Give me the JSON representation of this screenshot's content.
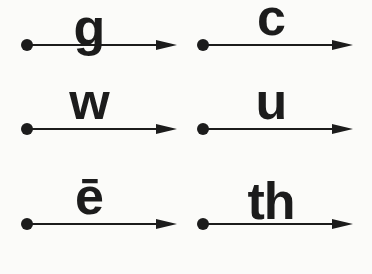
{
  "diagram": {
    "type": "labeled-arrow-grid",
    "description_semantics": "six dot-to-arrow timelines, each labeled with a phonics letter or digraph",
    "cells": [
      {
        "label": "g",
        "marker": "dot-icon",
        "pointer": "right-arrowhead-icon"
      },
      {
        "label": "c",
        "marker": "dot-icon",
        "pointer": "right-arrowhead-icon"
      },
      {
        "label": "w",
        "marker": "dot-icon",
        "pointer": "right-arrowhead-icon"
      },
      {
        "label": "u",
        "marker": "dot-icon",
        "pointer": "right-arrowhead-icon"
      },
      {
        "label": "ē",
        "marker": "dot-icon",
        "pointer": "right-arrowhead-icon"
      },
      {
        "label": "th",
        "marker": "dot-icon",
        "pointer": "right-arrowhead-icon"
      }
    ],
    "layout": {
      "rows": 3,
      "columns": 2,
      "order": "row-major"
    },
    "colors": {
      "ink": "#1c1c1c",
      "background": "#fbfbf9"
    }
  }
}
